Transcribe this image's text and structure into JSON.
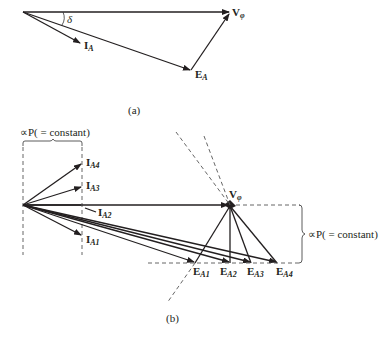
{
  "figure_a": {
    "caption": "(a)",
    "labels": {
      "v_phi": "V",
      "v_phi_sub": "φ",
      "i_a": "I",
      "i_a_sub": "A",
      "e_a": "E",
      "e_a_sub": "A",
      "delta": "δ"
    }
  },
  "figure_b": {
    "caption": "(b)",
    "left_brace_label": "∝P( = constant)",
    "right_brace_label": "∝P( = constant)",
    "v_phi": "V",
    "v_phi_sub": "φ",
    "currents": [
      {
        "main": "I",
        "sub": "A4"
      },
      {
        "main": "I",
        "sub": "A3"
      },
      {
        "main": "I",
        "sub": "A2"
      },
      {
        "main": "I",
        "sub": "A1"
      }
    ],
    "voltages": [
      {
        "main": "E",
        "sub": "A1"
      },
      {
        "main": "E",
        "sub": "A2"
      },
      {
        "main": "E",
        "sub": "A3"
      },
      {
        "main": "E",
        "sub": "A4"
      }
    ]
  }
}
